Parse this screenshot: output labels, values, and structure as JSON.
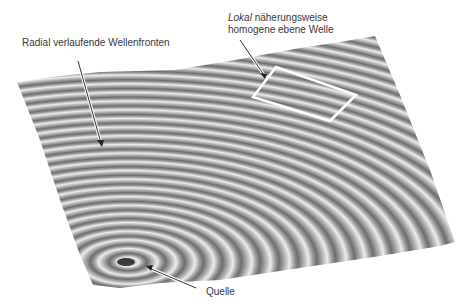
{
  "labels": {
    "wavefronts": "Radial verlaufende Wellenfronten",
    "local_prefix": "Lokal",
    "local_rest": " näherungsweise",
    "local_line2": "homogene ebene Welle",
    "source": "Quelle"
  },
  "colors": {
    "surface_light": "#e6e6e6",
    "surface_dark": "#7a7a7a",
    "text": "#3a3a3a",
    "marker": "#ffffff"
  },
  "geometry": {
    "surface_corners": [
      [
        17,
        82
      ],
      [
        375,
        36
      ],
      [
        455,
        242
      ],
      [
        93,
        285
      ]
    ],
    "source_center": [
      128,
      262
    ],
    "ring_count": 34
  }
}
